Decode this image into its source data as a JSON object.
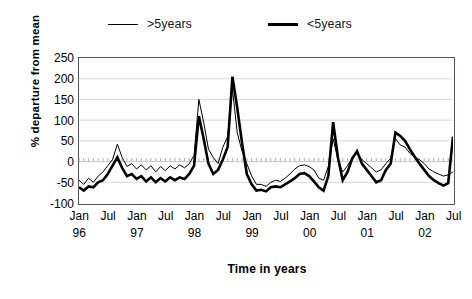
{
  "chart_data": {
    "type": "line",
    "title": "",
    "xlabel": "Time in years",
    "ylabel": "% departure from mean",
    "ylim": [
      -100,
      250
    ],
    "yticks": [
      250,
      200,
      150,
      100,
      50,
      0,
      -50,
      -100
    ],
    "grid": true,
    "grid_axis": "y",
    "legend_position": "top",
    "x_tick_labels": [
      {
        "month": "Jan",
        "year": "96"
      },
      {
        "month": "Jul",
        "year": ""
      },
      {
        "month": "Jan",
        "year": "97"
      },
      {
        "month": "Jul",
        "year": ""
      },
      {
        "month": "Jan",
        "year": "98"
      },
      {
        "month": "Jul",
        "year": ""
      },
      {
        "month": "Jan",
        "year": "99"
      },
      {
        "month": "Jul",
        "year": ""
      },
      {
        "month": "Jan",
        "year": "00"
      },
      {
        "month": "Jul",
        "year": ""
      },
      {
        "month": "Jan",
        "year": "01"
      },
      {
        "month": "Jul",
        "year": ""
      },
      {
        "month": "Jan",
        "year": "02"
      },
      {
        "month": "Jul",
        "year": ""
      }
    ],
    "x_index_range": [
      0,
      78
    ],
    "x_tick_indices": [
      0,
      6,
      12,
      18,
      24,
      30,
      36,
      42,
      48,
      54,
      60,
      66,
      72,
      78
    ],
    "series": [
      {
        "name": ">5years",
        "color": "#000000",
        "line_width": 1,
        "values": [
          -45,
          -55,
          -40,
          -50,
          -35,
          -25,
          -10,
          5,
          42,
          10,
          -12,
          -5,
          -18,
          -8,
          -20,
          -10,
          -25,
          -12,
          -22,
          -10,
          -18,
          -8,
          -15,
          -5,
          15,
          150,
          95,
          30,
          10,
          -5,
          35,
          60,
          175,
          70,
          25,
          -5,
          -35,
          -55,
          -55,
          -60,
          -50,
          -45,
          -48,
          -40,
          -30,
          -18,
          -10,
          -8,
          -12,
          -20,
          -40,
          -45,
          -12,
          55,
          5,
          -25,
          -10,
          10,
          20,
          5,
          -5,
          -15,
          -25,
          -20,
          -5,
          8,
          55,
          40,
          35,
          20,
          10,
          5,
          -5,
          -18,
          -25,
          -30,
          -35,
          -32,
          -25
        ]
      },
      {
        "name": "<5years",
        "color": "#000000",
        "line_width": 2.6,
        "values": [
          -62,
          -70,
          -60,
          -62,
          -50,
          -45,
          -30,
          -10,
          10,
          -15,
          -35,
          -30,
          -42,
          -35,
          -48,
          -38,
          -50,
          -40,
          -48,
          -38,
          -45,
          -38,
          -42,
          -30,
          -10,
          110,
          55,
          -5,
          -30,
          -20,
          5,
          35,
          205,
          130,
          45,
          -30,
          -55,
          -70,
          -68,
          -72,
          -62,
          -60,
          -62,
          -55,
          -48,
          -40,
          -30,
          -28,
          -35,
          -48,
          -62,
          -70,
          -35,
          95,
          10,
          -45,
          -25,
          8,
          25,
          -5,
          -20,
          -35,
          -50,
          -45,
          -20,
          -5,
          70,
          62,
          50,
          30,
          12,
          -5,
          -20,
          -35,
          -45,
          -52,
          -58,
          -52,
          60
        ]
      }
    ]
  },
  "legend": {
    "entries": [
      {
        "label": ">5years",
        "style": "thin"
      },
      {
        "label": "<5years",
        "style": "thick"
      }
    ]
  },
  "axes": {
    "y_label": "% departure from mean",
    "x_label": "Time in years",
    "y_tick_labels": [
      "250",
      "200",
      "150",
      "100",
      "50",
      "0",
      "-50",
      "-100"
    ]
  }
}
